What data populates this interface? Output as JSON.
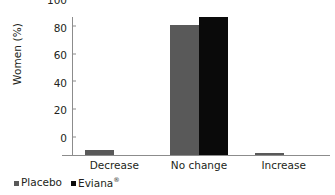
{
  "chart_data": {
    "type": "bar",
    "title": "",
    "xlabel": "",
    "ylabel": "Women (%)",
    "categories": [
      "Decrease",
      "No change",
      "Increase"
    ],
    "series": [
      {
        "name": "Placebo",
        "color": "#595959",
        "values": [
          3.5,
          94,
          1.5
        ]
      },
      {
        "name": "Eviana®",
        "color": "#0a0a0a",
        "values": [
          0,
          100,
          0
        ]
      }
    ],
    "ylim": [
      0,
      100
    ],
    "yticks": [
      0,
      20,
      40,
      60,
      80,
      100
    ],
    "ytick_labels": [
      "0",
      "20",
      "40",
      "60",
      "80",
      "100"
    ],
    "grid": false,
    "legend_position": "bottom-left"
  },
  "legend": {
    "items": [
      {
        "label": "Placebo",
        "sup": "",
        "color": "#595959"
      },
      {
        "label": "Eviana",
        "sup": "®",
        "color": "#0a0a0a"
      }
    ]
  },
  "axis": {
    "y_title": "Women (%)"
  },
  "colors": {
    "placebo": "#595959",
    "eviana": "#0a0a0a",
    "axis": "#8c8c8c",
    "text": "#231f20",
    "background": "#ffffff"
  }
}
